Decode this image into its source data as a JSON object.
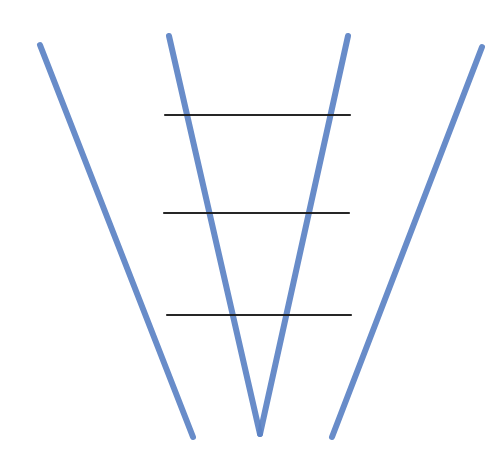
{
  "diagram": {
    "background": "#ffffff",
    "colors": {
      "blue_stroke": "#5b82c4",
      "black_stroke": "#1a1a1a"
    },
    "blue_lines": [
      {
        "name": "left-diagonal",
        "x1": 40,
        "y1": 45,
        "x2": 193,
        "y2": 437
      },
      {
        "name": "v-left-arm",
        "x1": 169,
        "y1": 36,
        "x2": 260,
        "y2": 434
      },
      {
        "name": "v-right-arm",
        "x1": 348,
        "y1": 36,
        "x2": 260,
        "y2": 434
      },
      {
        "name": "right-diagonal",
        "x1": 482,
        "y1": 47,
        "x2": 332,
        "y2": 437
      }
    ],
    "black_lines": [
      {
        "name": "rung-top",
        "x1": 165,
        "y1": 115,
        "x2": 350,
        "y2": 115
      },
      {
        "name": "rung-middle",
        "x1": 164,
        "y1": 213,
        "x2": 349,
        "y2": 213
      },
      {
        "name": "rung-bottom",
        "x1": 167,
        "y1": 315,
        "x2": 351,
        "y2": 315
      }
    ]
  }
}
